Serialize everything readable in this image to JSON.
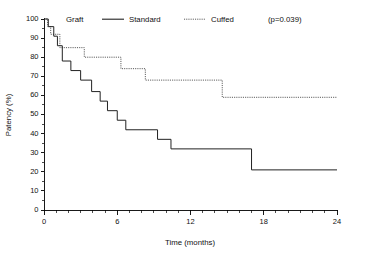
{
  "chart_data": {
    "type": "line",
    "subtype": "kaplan-meier-step",
    "title": "",
    "xlabel": "Time (months)",
    "ylabel": "Patency (%)",
    "xlim": [
      0,
      24
    ],
    "ylim": [
      0,
      100
    ],
    "x_ticks_major": [
      0,
      6,
      12,
      18,
      24
    ],
    "x_tick_labels": [
      "0",
      "6",
      "12",
      "18",
      "24"
    ],
    "x_minor_tick_step": 1,
    "y_ticks_major": [
      0,
      10,
      20,
      30,
      40,
      50,
      60,
      70,
      80,
      90,
      100
    ],
    "y_tick_labels": [
      "0",
      "10",
      "20",
      "30",
      "40",
      "50",
      "60",
      "70",
      "80",
      "90",
      "100"
    ],
    "grid": false,
    "legend_position": "top",
    "annotations": [
      {
        "name": "p-value",
        "text": "(p=0.039)"
      }
    ],
    "legend": [
      {
        "name": "legend-title",
        "label": "Graft",
        "style": "none"
      },
      {
        "name": "series-standard",
        "label": "Standard",
        "style": "solid",
        "color": "#222222"
      },
      {
        "name": "series-cuffed",
        "label": "Cuffed",
        "style": "dotted",
        "color": "#444444"
      }
    ],
    "series": [
      {
        "name": "Standard",
        "style": "solid",
        "color": "#222222",
        "points": [
          [
            0.0,
            100
          ],
          [
            0.35,
            96
          ],
          [
            0.35,
            96
          ],
          [
            0.8,
            91
          ],
          [
            1.1,
            86
          ],
          [
            1.5,
            78
          ],
          [
            2.2,
            73
          ],
          [
            3.0,
            68
          ],
          [
            3.9,
            62
          ],
          [
            4.6,
            57
          ],
          [
            5.2,
            52
          ],
          [
            6.0,
            47
          ],
          [
            6.7,
            42
          ],
          [
            9.0,
            42
          ],
          [
            9.3,
            37
          ],
          [
            10.1,
            37
          ],
          [
            10.4,
            32
          ],
          [
            17.0,
            32
          ],
          [
            17.0,
            21
          ],
          [
            24.0,
            21
          ]
        ],
        "steps": [
          {
            "time": 0.0,
            "patency": 100
          },
          {
            "time": 0.35,
            "patency": 96
          },
          {
            "time": 0.8,
            "patency": 91
          },
          {
            "time": 1.1,
            "patency": 86
          },
          {
            "time": 1.5,
            "patency": 78
          },
          {
            "time": 2.2,
            "patency": 73
          },
          {
            "time": 3.0,
            "patency": 68
          },
          {
            "time": 3.9,
            "patency": 62
          },
          {
            "time": 4.6,
            "patency": 57
          },
          {
            "time": 5.2,
            "patency": 52
          },
          {
            "time": 6.0,
            "patency": 47
          },
          {
            "time": 6.7,
            "patency": 42
          },
          {
            "time": 9.3,
            "patency": 37
          },
          {
            "time": 10.4,
            "patency": 32
          },
          {
            "time": 17.0,
            "patency": 21
          },
          {
            "time": 24.0,
            "patency": 21
          }
        ]
      },
      {
        "name": "Cuffed",
        "style": "dotted",
        "color": "#444444",
        "points": [
          [
            0.0,
            100
          ],
          [
            0.3,
            96
          ],
          [
            0.55,
            92
          ],
          [
            1.0,
            92
          ],
          [
            1.3,
            85
          ],
          [
            3.0,
            85
          ],
          [
            3.3,
            80
          ],
          [
            6.0,
            80
          ],
          [
            6.3,
            74
          ],
          [
            8.0,
            74
          ],
          [
            8.3,
            68
          ],
          [
            14.6,
            68
          ],
          [
            14.6,
            59
          ],
          [
            24.0,
            59
          ]
        ],
        "steps": [
          {
            "time": 0.0,
            "patency": 100
          },
          {
            "time": 0.3,
            "patency": 96
          },
          {
            "time": 0.55,
            "patency": 92
          },
          {
            "time": 1.3,
            "patency": 85
          },
          {
            "time": 3.3,
            "patency": 80
          },
          {
            "time": 6.3,
            "patency": 74
          },
          {
            "time": 8.3,
            "patency": 68
          },
          {
            "time": 14.6,
            "patency": 59
          },
          {
            "time": 24.0,
            "patency": 59
          }
        ]
      }
    ]
  }
}
